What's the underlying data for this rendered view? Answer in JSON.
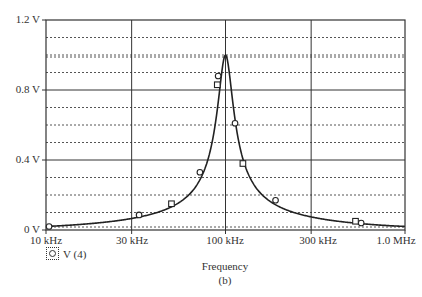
{
  "chart_data": {
    "type": "line",
    "title": "",
    "xlabel": "Frequency",
    "ylabel": "",
    "caption": "(b)",
    "x_scale": "log",
    "xlim": [
      10000,
      1000000
    ],
    "ylim": [
      0,
      1.2
    ],
    "x_ticks": [
      "10 kHz",
      "30 kHz",
      "100 kHz",
      "300 kHz",
      "1.0 MHz"
    ],
    "x_tick_values": [
      10000,
      30000,
      100000,
      300000,
      1000000
    ],
    "y_ticks": [
      "0 V",
      "0.4 V",
      "0.8 V",
      "1.2 V"
    ],
    "y_tick_values": [
      0,
      0.4,
      0.8,
      1.2
    ],
    "grid": true,
    "legend": [
      {
        "label": "V (4)",
        "marker": "circle"
      }
    ],
    "series": [
      {
        "name": "V (4)",
        "description": "Resonance curve peaking near 1.0 V at 100 kHz",
        "x": [
          10000,
          20000,
          33000,
          50000,
          72000,
          85000,
          92000,
          100000,
          108000,
          115000,
          130000,
          190000,
          300000,
          560000,
          1000000
        ],
        "y": [
          0.02,
          0.05,
          0.086,
          0.15,
          0.33,
          0.6,
          0.86,
          1.0,
          0.8,
          0.61,
          0.38,
          0.17,
          0.09,
          0.045,
          0.02
        ]
      }
    ],
    "markers": {
      "circles": [
        [
          10400,
          0.02
        ],
        [
          33000,
          0.086
        ],
        [
          72000,
          0.33
        ],
        [
          91000,
          0.88
        ],
        [
          113000,
          0.61
        ],
        [
          190000,
          0.17
        ],
        [
          570000,
          0.04
        ]
      ],
      "squares": [
        [
          50000,
          0.15
        ],
        [
          90000,
          0.83
        ],
        [
          125000,
          0.38
        ],
        [
          530000,
          0.05
        ]
      ]
    }
  },
  "labels": {
    "y": [
      "1.2 V",
      "0.8 V",
      "0.4 V",
      "0 V"
    ],
    "x": [
      "10 kHz",
      "30 kHz",
      "100 kHz",
      "300 kHz",
      "1.0 MHz"
    ],
    "legend": "V (4)",
    "xlabel": "Frequency",
    "caption": "(b)"
  }
}
